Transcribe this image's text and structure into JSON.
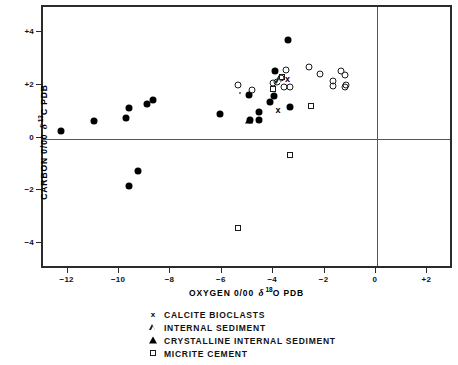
{
  "chart_data": {
    "type": "scatter",
    "title": "",
    "xlabel": "OXYGEN 0/00 δ 18O PDB",
    "ylabel": "CARBON 0/00 δ 13C PDB",
    "xlabel_parts": {
      "pre": "OXYGEN 0/00",
      "delta": "δ",
      "sup": "18",
      "post": "O  PDB"
    },
    "ylabel_parts": {
      "pre": "CARBON 0/00",
      "delta": "δ",
      "sup": "13",
      "post": "C  PDB"
    },
    "xlim": [
      -13,
      3
    ],
    "ylim": [
      -5,
      5
    ],
    "xticks": [
      -12,
      -10,
      -8,
      -6,
      -4,
      -2,
      0,
      2
    ],
    "xticklabels": [
      "−12",
      "−10",
      "−8",
      "−6",
      "−4",
      "−2",
      "0",
      "+2"
    ],
    "yticks": [
      4,
      2,
      0,
      -2,
      -4
    ],
    "yticklabels": [
      "+4",
      "+2",
      "0",
      "−2",
      "−4"
    ],
    "grid": false,
    "zero_lines": {
      "x": 0,
      "y": 0,
      "color": "#555555"
    },
    "legend_position": "below-plot",
    "series": [
      {
        "name": "filled-circle",
        "label": "",
        "marker": "filled-circle",
        "points": [
          [
            -12.3,
            0.3
          ],
          [
            -11.0,
            0.68
          ],
          [
            -9.65,
            1.15
          ],
          [
            -9.75,
            0.78
          ],
          [
            -8.95,
            1.32
          ],
          [
            -8.7,
            1.45
          ],
          [
            -9.65,
            -1.82
          ],
          [
            -9.3,
            -1.22
          ],
          [
            -6.1,
            0.92
          ],
          [
            -5.0,
            1.65
          ],
          [
            -4.95,
            0.72
          ],
          [
            -4.6,
            0.7
          ],
          [
            -4.6,
            1.02
          ],
          [
            -4.15,
            1.38
          ],
          [
            -4.0,
            1.62
          ],
          [
            -3.95,
            2.55
          ],
          [
            -3.45,
            3.75
          ],
          [
            -3.4,
            1.2
          ]
        ]
      },
      {
        "name": "open-circle",
        "label": "",
        "marker": "open-circle",
        "points": [
          [
            -5.4,
            2.02
          ],
          [
            -4.85,
            1.85
          ],
          [
            -4.05,
            2.12
          ],
          [
            -3.9,
            2.15
          ],
          [
            -3.72,
            2.3
          ],
          [
            -3.6,
            1.95
          ],
          [
            -3.55,
            2.6
          ],
          [
            -3.4,
            1.95
          ],
          [
            -2.65,
            2.7
          ],
          [
            -2.2,
            2.45
          ],
          [
            -1.7,
            1.98
          ],
          [
            -1.7,
            2.18
          ],
          [
            -1.4,
            2.55
          ],
          [
            -1.25,
            2.42
          ],
          [
            -1.25,
            1.95
          ],
          [
            -1.2,
            2.05
          ]
        ]
      },
      {
        "name": "open-square",
        "label": "",
        "marker": "open-square",
        "points": [
          [
            -4.05,
            1.88
          ],
          [
            -3.68,
            2.32
          ],
          [
            -2.55,
            1.25
          ],
          [
            -3.4,
            -0.62
          ],
          [
            -5.4,
            -3.4
          ]
        ]
      },
      {
        "name": "open-triangle",
        "label": "",
        "marker": "open-triangle",
        "points": [
          [
            -3.82,
            2.22
          ]
        ]
      },
      {
        "name": "filled-triangle",
        "label": "",
        "marker": "filled-triangle",
        "points": [
          [
            -5.0,
            0.72
          ]
        ]
      },
      {
        "name": "cross",
        "label": "",
        "marker": "cross",
        "points": [
          [
            -3.48,
            2.28
          ],
          [
            -3.85,
            1.08
          ]
        ]
      },
      {
        "name": "small-dot",
        "label": "",
        "marker": "dot",
        "points": [
          [
            -5.35,
            1.72
          ]
        ]
      }
    ],
    "legend": [
      {
        "marker": "cross",
        "label": "CALCITE BIOCLASTS"
      },
      {
        "marker": "open-triangle",
        "label": "INTERNAL SEDIMENT"
      },
      {
        "marker": "filled-triangle",
        "label": "CRYSTALLINE INTERNAL SEDIMENT"
      },
      {
        "marker": "open-square",
        "label": "MICRITE CEMENT"
      }
    ]
  }
}
